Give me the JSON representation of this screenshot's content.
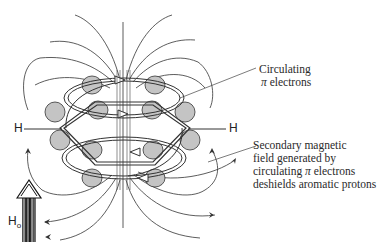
{
  "diagram": {
    "atoms": {
      "left_h": "H",
      "right_h": "H"
    },
    "field": {
      "label": "H",
      "subscript": "o"
    },
    "annotations": {
      "circulating": {
        "line1": "Circulating",
        "pi": "π",
        "line2_rest": " electrons"
      },
      "secondary": {
        "line1": "Secondary magnetic",
        "line2": "field generated by",
        "line3_pre": "circulating ",
        "pi": "π",
        "line3_post": " electrons",
        "line4": "deshields aromatic protons"
      }
    },
    "colors": {
      "ink": "#2a2a2a",
      "lobe_fill": "#bdbdbd",
      "background": "#ffffff"
    }
  }
}
